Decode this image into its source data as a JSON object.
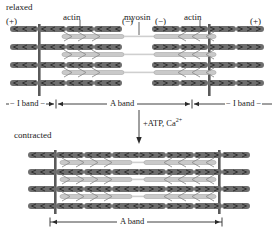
{
  "figure": {
    "colors": {
      "actin": "#6e6e6e",
      "actin_dark": "#4a4a4a",
      "myosin": "#bdbdbd",
      "z_line": "#5a5a5a",
      "text": "#1a1a1a",
      "background": "#ffffff"
    }
  },
  "panels": [
    {
      "id": "relaxed",
      "state_label": "relaxed",
      "polarity_left_outer": "(+)",
      "polarity_left_inner": "(−)",
      "polarity_right_inner": "(−)",
      "polarity_right_outer": "(+)",
      "callouts": [
        {
          "name": "actin-left",
          "text": "actin"
        },
        {
          "name": "myosin",
          "text": "myosin"
        },
        {
          "name": "actin-right",
          "text": "actin"
        }
      ],
      "bands": [
        {
          "name": "i-band-left",
          "text": "− I band −"
        },
        {
          "name": "a-band",
          "text": "A band"
        },
        {
          "name": "i-band-right",
          "text": "− I band −"
        }
      ],
      "filament_rows": 4,
      "z_lines": 2
    },
    {
      "id": "contracted",
      "state_label": "contracted",
      "bands": [
        {
          "name": "a-band",
          "text": "A band"
        }
      ],
      "filament_rows": 4,
      "z_lines": 2
    }
  ],
  "transition": {
    "name": "atp-calcium-arrow",
    "text": "+ATP, Ca",
    "superscript": "2+",
    "direction": "down"
  }
}
